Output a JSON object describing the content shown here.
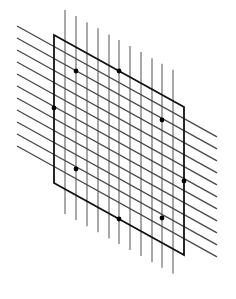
{
  "diagram": {
    "colors": {
      "background": "#ffffff",
      "vertical_lines": "#7a7a7a",
      "oblique_lines": "#4a4a4a",
      "frame": "#111111",
      "dots": "#000000"
    },
    "parallelogram": {
      "corners": [
        [
          54,
          35
        ],
        [
          184,
          107
        ],
        [
          184,
          255
        ],
        [
          54,
          183
        ]
      ]
    },
    "vertical_lines": {
      "x": [
        65,
        76,
        87,
        98,
        109,
        119,
        130,
        141,
        152,
        162,
        173
      ],
      "top_at_x65": 10,
      "bottom_at_x65": 214,
      "slope": 0.554
    },
    "oblique_lines": {
      "x_start": 17,
      "x_end": 217,
      "y_start": [
        26,
        38,
        50,
        62,
        74,
        86,
        98,
        110,
        122,
        134,
        146
      ],
      "slope": 0.554
    },
    "dots": [
      [
        76,
        71
      ],
      [
        119,
        71
      ],
      [
        162,
        120
      ],
      [
        54,
        108
      ],
      [
        184,
        181
      ],
      [
        76,
        169
      ],
      [
        119,
        219
      ],
      [
        162,
        218
      ]
    ]
  }
}
